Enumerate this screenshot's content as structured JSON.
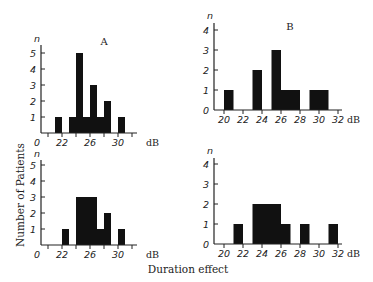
{
  "chart_data": [
    {
      "id": "top-left",
      "type": "bar",
      "panel_label": "A",
      "y_symbol": "n",
      "x_unit": "dB",
      "x_tick_labels": [
        "0",
        "22",
        "26",
        "30"
      ],
      "y_ticks": [
        1,
        2,
        3,
        4,
        5
      ],
      "ylim": [
        0,
        5
      ],
      "bins": [
        {
          "x0": 21,
          "x1": 22,
          "count": 1
        },
        {
          "x0": 23,
          "x1": 24,
          "count": 1
        },
        {
          "x0": 24,
          "x1": 25,
          "count": 5
        },
        {
          "x0": 25,
          "x1": 26,
          "count": 1
        },
        {
          "x0": 26,
          "x1": 27,
          "count": 3
        },
        {
          "x0": 27,
          "x1": 28,
          "count": 1
        },
        {
          "x0": 28,
          "x1": 29,
          "count": 2
        },
        {
          "x0": 30,
          "x1": 31,
          "count": 1
        }
      ]
    },
    {
      "id": "top-right",
      "type": "bar",
      "panel_label": "B",
      "y_symbol": "n",
      "x_unit": "dB",
      "x_tick_labels": [
        "20",
        "22",
        "24",
        "26",
        "28",
        "30",
        "32"
      ],
      "y_ticks": [
        0,
        1,
        2,
        3,
        4
      ],
      "ylim": [
        0,
        4
      ],
      "bins": [
        {
          "x0": 20,
          "x1": 21,
          "count": 1
        },
        {
          "x0": 23,
          "x1": 24,
          "count": 2
        },
        {
          "x0": 25,
          "x1": 26,
          "count": 3
        },
        {
          "x0": 26,
          "x1": 28,
          "count": 1
        },
        {
          "x0": 29,
          "x1": 31,
          "count": 1
        }
      ]
    },
    {
      "id": "bottom-left",
      "type": "bar",
      "panel_label": "",
      "y_symbol": "n",
      "x_unit": "dB",
      "x_tick_labels": [
        "0",
        "22",
        "26",
        "30"
      ],
      "y_ticks": [
        1,
        2,
        3,
        4,
        5
      ],
      "ylim": [
        0,
        5
      ],
      "bins": [
        {
          "x0": 22,
          "x1": 23,
          "count": 1
        },
        {
          "x0": 24,
          "x1": 27,
          "count": 3
        },
        {
          "x0": 27,
          "x1": 28,
          "count": 1
        },
        {
          "x0": 28,
          "x1": 29,
          "count": 2
        },
        {
          "x0": 30,
          "x1": 31,
          "count": 1
        }
      ]
    },
    {
      "id": "bottom-right",
      "type": "bar",
      "panel_label": "",
      "y_symbol": "n",
      "x_unit": "dB",
      "x_tick_labels": [
        "20",
        "22",
        "24",
        "26",
        "28",
        "30",
        "32"
      ],
      "y_ticks": [
        0,
        1,
        2,
        3,
        4
      ],
      "ylim": [
        0,
        4
      ],
      "bins": [
        {
          "x0": 21,
          "x1": 22,
          "count": 1
        },
        {
          "x0": 23,
          "x1": 26,
          "count": 2
        },
        {
          "x0": 26,
          "x1": 27,
          "count": 1
        },
        {
          "x0": 28,
          "x1": 29,
          "count": 1
        },
        {
          "x0": 31,
          "x1": 32,
          "count": 1
        }
      ]
    }
  ],
  "labels": {
    "ylabel": "Number of Patients",
    "xlabel": "Duration effect"
  },
  "colors": {
    "bar": "#111111",
    "axis": "#222222",
    "background": "#ffffff"
  }
}
